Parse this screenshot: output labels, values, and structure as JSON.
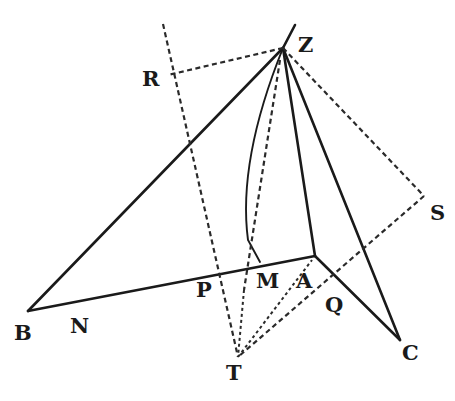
{
  "figure": {
    "labels": {
      "Z": "Z",
      "R": "R",
      "S": "S",
      "B": "B",
      "N": "N",
      "P": "P",
      "M": "M",
      "A": "A",
      "Q": "Q",
      "C": "C",
      "T": "T"
    },
    "solid_lines": [
      [
        "Z",
        "B"
      ],
      [
        "Z",
        "A"
      ],
      [
        "Z",
        "C"
      ],
      [
        "B",
        "A"
      ],
      [
        "A",
        "C"
      ]
    ],
    "curves": [
      [
        "Z",
        "M"
      ]
    ],
    "dashed_lines": [
      [
        "R",
        "T"
      ],
      [
        "Z",
        "R"
      ],
      [
        "Z",
        "S"
      ],
      [
        "S",
        "T"
      ],
      [
        "T",
        "A"
      ],
      [
        "T",
        "M"
      ],
      [
        "Z",
        "M"
      ]
    ]
  }
}
